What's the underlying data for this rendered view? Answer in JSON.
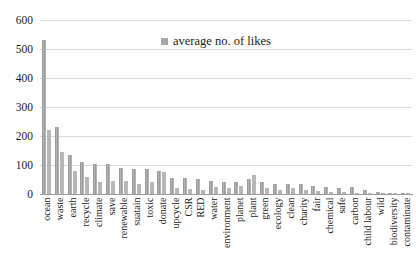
{
  "chart_data": {
    "type": "bar",
    "title": "",
    "legend_position": "top-center",
    "legend_label": "average no. of likes",
    "categories": [
      "ocean",
      "waste",
      "earth",
      "recycle",
      "climate",
      "save",
      "renewable",
      "suatain",
      "toxic",
      "donate",
      "upcycle",
      "CSR",
      "RED",
      "water",
      "environment",
      "planet",
      "plant",
      "green",
      "ecology",
      "clean",
      "charity",
      "fair",
      "chemical",
      "safe",
      "carbon",
      "child labour",
      "wild",
      "biodiversity",
      "contaminate"
    ],
    "series": [
      {
        "name": "average no. of likes",
        "color": "#a6a6a6",
        "pattern": "vertical-stripe",
        "values": [
          530,
          230,
          135,
          110,
          105,
          105,
          90,
          85,
          85,
          80,
          55,
          55,
          50,
          45,
          42,
          40,
          50,
          40,
          35,
          35,
          35,
          28,
          25,
          22,
          25,
          15,
          8,
          5,
          2
        ]
      },
      {
        "name": "",
        "color": "#b6b6b6",
        "pattern": "solid",
        "values": [
          220,
          145,
          80,
          60,
          40,
          45,
          45,
          35,
          40,
          75,
          20,
          18,
          15,
          25,
          20,
          28,
          65,
          20,
          15,
          20,
          15,
          10,
          8,
          7,
          5,
          3,
          2,
          1,
          1
        ]
      }
    ],
    "xlabel": "",
    "ylabel": "",
    "ylim": [
      0,
      600
    ],
    "yticks": [
      0,
      100,
      200,
      300,
      400,
      500,
      600
    ],
    "grid": true,
    "colors": {
      "gridline": "#d9d9d9",
      "axis_line": "#9b9b9b",
      "text": "#1a1a1a",
      "background": "#ffffff",
      "bar_series_1": "#a6a6a6",
      "bar_series_2": "#b6b6b6"
    }
  }
}
